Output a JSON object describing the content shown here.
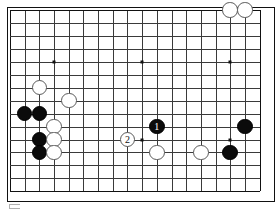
{
  "app": {
    "type": "go-board-diagram",
    "title": "Go game position diagram"
  },
  "board": {
    "columns": 18,
    "rows": 15,
    "partial_view": true,
    "line_color": "#3a3a3a",
    "edge_color": "#111111",
    "background_color": "#ffffff",
    "star_points": [
      {
        "col": 3,
        "row": 4
      },
      {
        "col": 9,
        "row": 4
      },
      {
        "col": 15,
        "row": 4
      },
      {
        "col": 9,
        "row": 10
      },
      {
        "col": 15,
        "row": 10
      }
    ]
  },
  "stones": [
    {
      "id": "w-top-a",
      "color": "white",
      "col": 15,
      "row": 0,
      "label": ""
    },
    {
      "id": "w-top-b",
      "color": "white",
      "col": 16,
      "row": 0,
      "label": ""
    },
    {
      "id": "w-left-a",
      "color": "white",
      "col": 2,
      "row": 6,
      "label": ""
    },
    {
      "id": "w-left-b",
      "color": "white",
      "col": 4,
      "row": 7,
      "label": ""
    },
    {
      "id": "b-left-a",
      "color": "black",
      "col": 1,
      "row": 8,
      "label": ""
    },
    {
      "id": "b-left-b",
      "color": "black",
      "col": 2,
      "row": 8,
      "label": ""
    },
    {
      "id": "w-left-c",
      "color": "white",
      "col": 3,
      "row": 9,
      "label": ""
    },
    {
      "id": "b-left-c",
      "color": "black",
      "col": 2,
      "row": 10,
      "label": ""
    },
    {
      "id": "w-left-d",
      "color": "white",
      "col": 3,
      "row": 10,
      "label": ""
    },
    {
      "id": "b-left-d",
      "color": "black",
      "col": 2,
      "row": 11,
      "label": ""
    },
    {
      "id": "w-left-e",
      "color": "white",
      "col": 3,
      "row": 11,
      "label": ""
    },
    {
      "id": "move-1",
      "color": "black",
      "col": 10,
      "row": 9,
      "label": "1"
    },
    {
      "id": "move-2",
      "color": "white",
      "col": 8,
      "row": 10,
      "label": "2"
    },
    {
      "id": "w-bot-a",
      "color": "white",
      "col": 10,
      "row": 11,
      "label": ""
    },
    {
      "id": "w-bot-b",
      "color": "white",
      "col": 13,
      "row": 11,
      "label": ""
    },
    {
      "id": "b-right-a",
      "color": "black",
      "col": 16,
      "row": 9,
      "label": ""
    },
    {
      "id": "b-right-b",
      "color": "black",
      "col": 15,
      "row": 11,
      "label": ""
    }
  ],
  "moves": [
    {
      "number": "1",
      "color": "black"
    },
    {
      "number": "2",
      "color": "white"
    }
  ],
  "footer": {
    "mark": "page-corner-mark"
  }
}
